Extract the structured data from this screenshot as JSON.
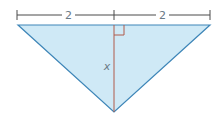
{
  "diagram": {
    "type": "isosceles-triangle-with-altitude",
    "dimension_left_label": "2",
    "dimension_right_label": "2",
    "altitude_label": "x",
    "right_angle_marker": true,
    "colors": {
      "fill": "#cfe9f6",
      "edge": "#3e86b8",
      "altitude": "#b05a4a",
      "dimension_line": "#4a4a4a",
      "label": "#6a7a86"
    }
  }
}
